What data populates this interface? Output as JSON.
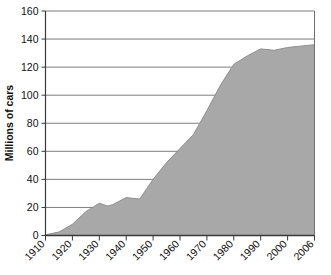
{
  "chart_data": {
    "type": "area",
    "title": "",
    "xlabel": "",
    "ylabel": "Millions of cars",
    "ylim": [
      0,
      160
    ],
    "ytick_step": 20,
    "yticks": [
      0,
      20,
      40,
      60,
      80,
      100,
      120,
      140,
      160
    ],
    "ytick_labels": [
      "0",
      "20",
      "40",
      "60",
      "80",
      "100",
      "120",
      "140",
      "160"
    ],
    "xticks": [
      1910,
      1920,
      1930,
      1940,
      1950,
      1960,
      1970,
      1980,
      1990,
      2000,
      2006
    ],
    "xtick_labels": [
      "1910",
      "1920",
      "1930",
      "1940",
      "1950",
      "1960",
      "1970",
      "1980",
      "1990",
      "2000",
      "2006"
    ],
    "xlim": [
      1910,
      2006
    ],
    "grid": "horizontal",
    "legend": "none",
    "area_color": "#a8a8a8",
    "line_color": "#8f8f8f",
    "grid_color": "#6f6f6f",
    "axis_color": "#3a3a3a",
    "series": [
      {
        "name": "Cars in use",
        "x": [
          1910,
          1915,
          1920,
          1925,
          1930,
          1933,
          1935,
          1940,
          1945,
          1950,
          1955,
          1960,
          1965,
          1970,
          1975,
          1980,
          1985,
          1990,
          1995,
          2000,
          2006
        ],
        "values": [
          0.5,
          2.5,
          8,
          17,
          23,
          21,
          22,
          27,
          26,
          40,
          52,
          62,
          72,
          89,
          107,
          122,
          128,
          133,
          132,
          134,
          136
        ]
      }
    ]
  },
  "axis": {
    "ylabel": "Millions of cars"
  }
}
